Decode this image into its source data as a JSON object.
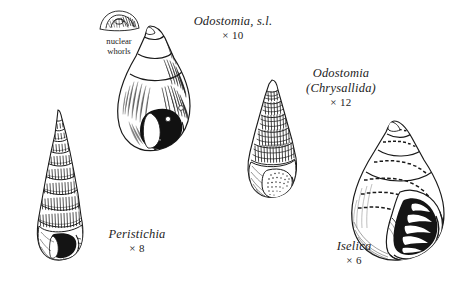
{
  "plate": {
    "background_color": "#ffffff",
    "ink_color": "#1a1a1a",
    "width": 463,
    "height": 289
  },
  "callouts": [
    {
      "id": "nuclear-whorls",
      "line1": "nuclear",
      "line2": "whorls",
      "description": "detail inset of heterostrophic protoconch"
    }
  ],
  "figures": [
    {
      "id": "peristichia",
      "taxon": "Peristichia",
      "subgenus": "",
      "magnification": "× 8",
      "shell_form": "tall slender turreted spire, many whorls, beaded spiral sculpture, dark aperture at base"
    },
    {
      "id": "odostomia-sl",
      "taxon": "Odostomia, s.l.",
      "subgenus": "",
      "magnification": "× 10",
      "shell_form": "smooth ovate-conic shell, fine hatched shading, solid black aperture with white highlights"
    },
    {
      "id": "odostomia-chrysallida",
      "taxon": "Odostomia",
      "subgenus": "(Chrysallida)",
      "magnification": "× 12",
      "shell_form": "conical shell with strong cancellate lattice sculpture, stippled aperture"
    },
    {
      "id": "iselica",
      "taxon": "Iselica",
      "subgenus": "",
      "magnification": "× 6",
      "shell_form": "squat globose shell, dashed spiral bands, large open aperture with bold black shading"
    }
  ]
}
